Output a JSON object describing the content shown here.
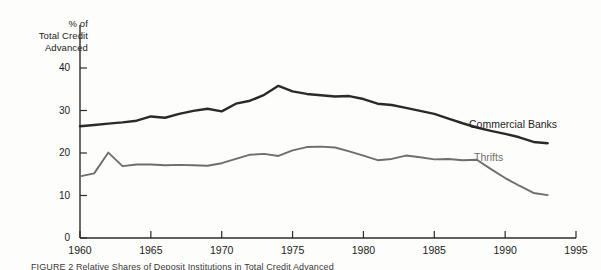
{
  "chart_data": {
    "type": "line",
    "title": "",
    "ylabel": "% of\nTotal Credit\nAdvanced",
    "xlabel": "",
    "xlim": [
      1960,
      1995
    ],
    "ylim": [
      0,
      43
    ],
    "grid": false,
    "legend_position": "inline-right",
    "y_ticks": [
      0,
      10,
      20,
      30,
      40
    ],
    "y_tick_labels": [
      "0",
      "10",
      "20",
      "30",
      "40"
    ],
    "x_ticks": [
      1960,
      1965,
      1970,
      1975,
      1980,
      1985,
      1990,
      1995
    ],
    "x_tick_labels": [
      "1960",
      "1965",
      "1970",
      "1975",
      "1980",
      "1985",
      "1990",
      "1995"
    ],
    "x": [
      1960,
      1961,
      1962,
      1963,
      1964,
      1965,
      1966,
      1967,
      1968,
      1969,
      1970,
      1971,
      1972,
      1973,
      1974,
      1975,
      1976,
      1977,
      1978,
      1979,
      1980,
      1981,
      1982,
      1983,
      1984,
      1985,
      1986,
      1987,
      1988,
      1989,
      1990,
      1991,
      1992,
      1993
    ],
    "series": [
      {
        "name": "Commercial Banks",
        "color": "#2a2a2a",
        "width": 2.4,
        "values": [
          26.3,
          26.6,
          26.9,
          27.2,
          27.6,
          28.6,
          28.3,
          29.2,
          29.9,
          30.4,
          29.8,
          31.6,
          32.3,
          33.7,
          35.8,
          34.5,
          33.9,
          33.6,
          33.3,
          33.4,
          32.7,
          31.6,
          31.3,
          30.6,
          29.9,
          29.2,
          28.1,
          27.0,
          26.0,
          25.2,
          24.5,
          23.7,
          22.6,
          22.3
        ]
      },
      {
        "name": "Thrifts",
        "color": "#6e6e6e",
        "width": 1.9,
        "values": [
          14.5,
          15.2,
          20.1,
          16.9,
          17.3,
          17.3,
          17.1,
          17.2,
          17.1,
          17.0,
          17.6,
          18.6,
          19.6,
          19.8,
          19.3,
          20.6,
          21.4,
          21.5,
          21.3,
          20.4,
          19.4,
          18.3,
          18.6,
          19.4,
          19.0,
          18.5,
          18.6,
          18.3,
          18.4,
          16.2,
          14.1,
          12.3,
          10.6,
          10.1
        ]
      }
    ]
  },
  "labels": {
    "axis_title": "% of\nTotal Credit\nAdvanced",
    "commercial_banks": "Commercial Banks",
    "thrifts": "Thrifts"
  },
  "caption": "FIGURE 2  Relative Shares of Deposit Institutions in Total Credit Advanced"
}
